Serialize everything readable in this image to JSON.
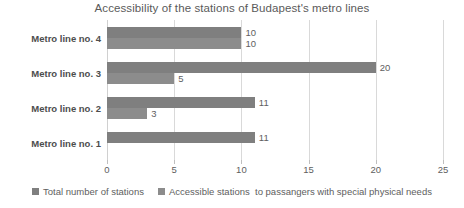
{
  "chart_data": {
    "type": "bar",
    "orientation": "horizontal",
    "title": "Accessibility of the stations of Budapest's metro lines",
    "xlabel": "",
    "ylabel": "",
    "categories": [
      "Metro line no. 1",
      "Metro line no. 2",
      "Metro line no. 3",
      "Metro line no.  4"
    ],
    "series": [
      {
        "name": "Total number of stations",
        "color": "#7f7f7f",
        "values": [
          11,
          11,
          20,
          10
        ]
      },
      {
        "name": "Accessible stations  to passangers with special physical needs",
        "color": "#8c8c8c",
        "values": [
          0,
          3,
          5,
          10
        ]
      }
    ],
    "xlim": [
      0,
      25
    ],
    "xticks": [
      "0",
      "5",
      "10",
      "15",
      "20",
      "25"
    ],
    "xtick_values": [
      0,
      5,
      10,
      15,
      20,
      25
    ],
    "grid": true,
    "legend_position": "bottom",
    "value_labels": {
      "Metro line no. 1": [
        "11",
        ""
      ],
      "Metro line no. 2": [
        "11",
        "3"
      ],
      "Metro line no. 3": [
        "20",
        "5"
      ],
      "Metro line no.  4": [
        "10",
        "10"
      ]
    }
  }
}
